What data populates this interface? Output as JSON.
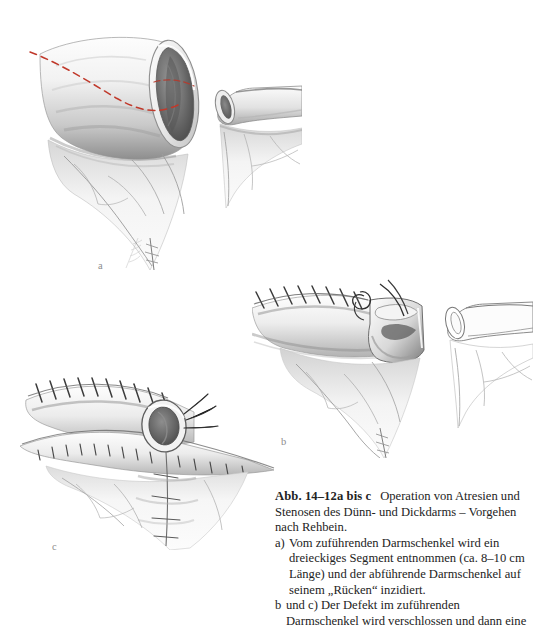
{
  "page": {
    "background": "#ffffff",
    "ink": "#2b2b2b",
    "incision_line_color": "#c0392b"
  },
  "figure": {
    "panels": [
      {
        "id": "a",
        "label": "a",
        "description": "Dilatierter zuführender Darmschenkel mit eröffnetem Lumen und rot markierter Resektionslinie; rechts der schmale abführende Darmschenkel."
      },
      {
        "id": "b",
        "label": "b",
        "description": "Verschluss des Defektes im zuführenden Darmschenkel mit fortlaufender Naht, Nadel und Faden am Nahtbeginn."
      },
      {
        "id": "c",
        "label": "c",
        "description": "Fertiggestellte Anastomose mit fortlaufender Nahtreihe und adaptiertem Mesenterium."
      }
    ],
    "artist_signature": "signature"
  },
  "caption": {
    "figure_number": "Abb. 14–12a bis c",
    "title_line_1": "Operation von Atresien",
    "title_line_2": "und Stenosen des Dünn- und Dickdarms –",
    "title_line_3": "Vorgehen nach Rehbein.",
    "items": [
      {
        "marker": "a)",
        "text": "Vom zuführenden Darmschenkel wird ein dreieckiges Segment entnommen (ca. 8–10 cm Länge) und der abführende Darmschenkel auf seinem „Rücken“ inzidiert."
      },
      {
        "marker": "b",
        "text": "und c) Der Defekt im zuführenden Darmschenkel wird verschlossen und dann eine"
      }
    ]
  }
}
